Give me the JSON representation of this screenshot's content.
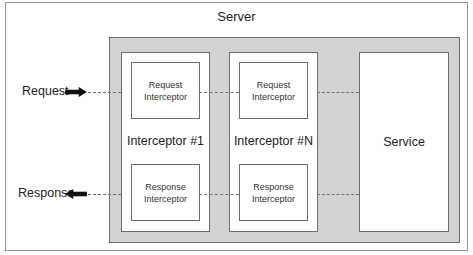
{
  "diagram": {
    "title": "Server",
    "left_labels": {
      "request": "Request",
      "response": "Response"
    },
    "interceptors": [
      {
        "label": "Interceptor #1",
        "request_box": "Request Interceptor",
        "response_box": "Response Interceptor"
      },
      {
        "label": "Interceptor #N",
        "request_box": "Request Interceptor",
        "response_box": "Response Interceptor"
      }
    ],
    "service": "Service",
    "icons": {
      "request_arrow": "arrow-right-icon",
      "response_arrow": "arrow-left-icon"
    },
    "colors": {
      "container_fill": "#d2d2d2",
      "border": "#6e6e6e",
      "arrow": "#111111"
    }
  }
}
